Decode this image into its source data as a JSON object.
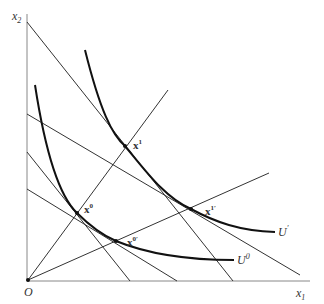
{
  "axes": {
    "x_label": "x",
    "x_sub": "1",
    "y_label": "x",
    "y_sub": "2",
    "origin_label": "O"
  },
  "curves": {
    "u_prime": {
      "label": "U",
      "sup": "′"
    },
    "u_zero": {
      "label": "U",
      "sup": "0"
    }
  },
  "points": {
    "x0": {
      "label": "x",
      "sup": "0"
    },
    "x1": {
      "label": "x",
      "sup": "1"
    },
    "x0p": {
      "label": "x",
      "sup": "0′"
    },
    "x1p": {
      "label": "x",
      "sup": "1′"
    }
  },
  "colors": {
    "line": "#333333",
    "curve": "#111111",
    "axis": "#777777"
  }
}
